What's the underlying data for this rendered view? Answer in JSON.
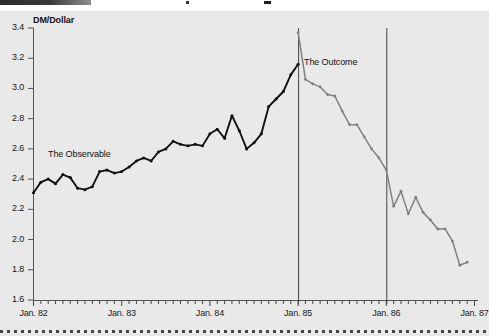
{
  "figure": {
    "y_axis_title": "DM/Dollar",
    "y_ticks": [
      "3.4",
      "3.2",
      "3.0",
      "2.8",
      "2.6",
      "2.4",
      "2.2",
      "2.0",
      "1.8",
      "1.6"
    ],
    "x_ticks": [
      "Jan. 82",
      "Jan. 83",
      "Jan. 84",
      "Jan. 85",
      "Jan. 86",
      "Jan. 87"
    ],
    "annotations": [
      {
        "text": "The Observable"
      },
      {
        "text": "The Outcome"
      }
    ],
    "colors": {
      "panel_background": "#e9e9e9",
      "observable_series": "#111111",
      "outcome_series": "#808080",
      "axis": "#555555",
      "divider": "#444444"
    }
  },
  "chart_data": {
    "type": "line",
    "title": "",
    "xlabel": "",
    "ylabel": "DM/Dollar",
    "ylim": [
      1.6,
      3.4
    ],
    "ytick_values": [
      1.6,
      1.8,
      2.0,
      2.2,
      2.4,
      2.6,
      2.8,
      3.0,
      3.2,
      3.4
    ],
    "xlim": [
      "Jan. 82",
      "Jan. 87"
    ],
    "xtick_labels": [
      "Jan. 82",
      "Jan. 83",
      "Jan. 84",
      "Jan. 85",
      "Jan. 86",
      "Jan. 87"
    ],
    "grid": false,
    "legend": "none",
    "annotations": [
      {
        "text": "The Observable",
        "x": "Jul. 82",
        "y": 2.62
      },
      {
        "text": "The Outcome",
        "x": "Apr. 85",
        "y": 3.17
      }
    ],
    "vertical_reference_lines": [
      "Jan. 85",
      "Jan. 86"
    ],
    "series": [
      {
        "name": "The Observable",
        "color": "#111111",
        "x": [
          "Jan. 82",
          "Feb. 82",
          "Mar. 82",
          "Apr. 82",
          "May 82",
          "Jun. 82",
          "Jul. 82",
          "Aug. 82",
          "Sep. 82",
          "Oct. 82",
          "Nov. 82",
          "Dec. 82",
          "Jan. 83",
          "Feb. 83",
          "Mar. 83",
          "Apr. 83",
          "May 83",
          "Jun. 83",
          "Jul. 83",
          "Aug. 83",
          "Sep. 83",
          "Oct. 83",
          "Nov. 83",
          "Dec. 83",
          "Jan. 84",
          "Feb. 84",
          "Mar. 84",
          "Apr. 84",
          "May 84",
          "Jun. 84",
          "Jul. 84",
          "Aug. 84",
          "Sep. 84",
          "Oct. 84",
          "Nov. 84",
          "Dec. 84",
          "Jan. 85"
        ],
        "values": [
          2.31,
          2.38,
          2.4,
          2.37,
          2.43,
          2.41,
          2.34,
          2.33,
          2.35,
          2.45,
          2.46,
          2.44,
          2.45,
          2.48,
          2.52,
          2.54,
          2.52,
          2.58,
          2.6,
          2.65,
          2.63,
          2.62,
          2.63,
          2.62,
          2.7,
          2.73,
          2.67,
          2.82,
          2.72,
          2.6,
          2.64,
          2.7,
          2.88,
          2.93,
          2.98,
          3.09,
          3.16
        ]
      },
      {
        "name": "The Outcome",
        "color": "#808080",
        "x": [
          "Jan. 85",
          "Feb. 85",
          "Mar. 85",
          "Apr. 85",
          "May 85",
          "Jun. 85",
          "Jul. 85",
          "Aug. 85",
          "Sep. 85",
          "Oct. 85",
          "Nov. 85",
          "Dec. 85",
          "Jan. 86",
          "Feb. 86",
          "Mar. 86",
          "Apr. 86",
          "May 86",
          "Jun. 86",
          "Jul. 86",
          "Aug. 86",
          "Sep. 86",
          "Oct. 86",
          "Nov. 86",
          "Dec. 86"
        ],
        "values": [
          3.37,
          3.06,
          3.03,
          3.01,
          2.96,
          2.95,
          2.85,
          2.76,
          2.76,
          2.68,
          2.6,
          2.54,
          2.46,
          2.22,
          2.32,
          2.17,
          2.28,
          2.18,
          2.13,
          2.07,
          2.07,
          1.99,
          1.83,
          1.85
        ]
      }
    ]
  }
}
